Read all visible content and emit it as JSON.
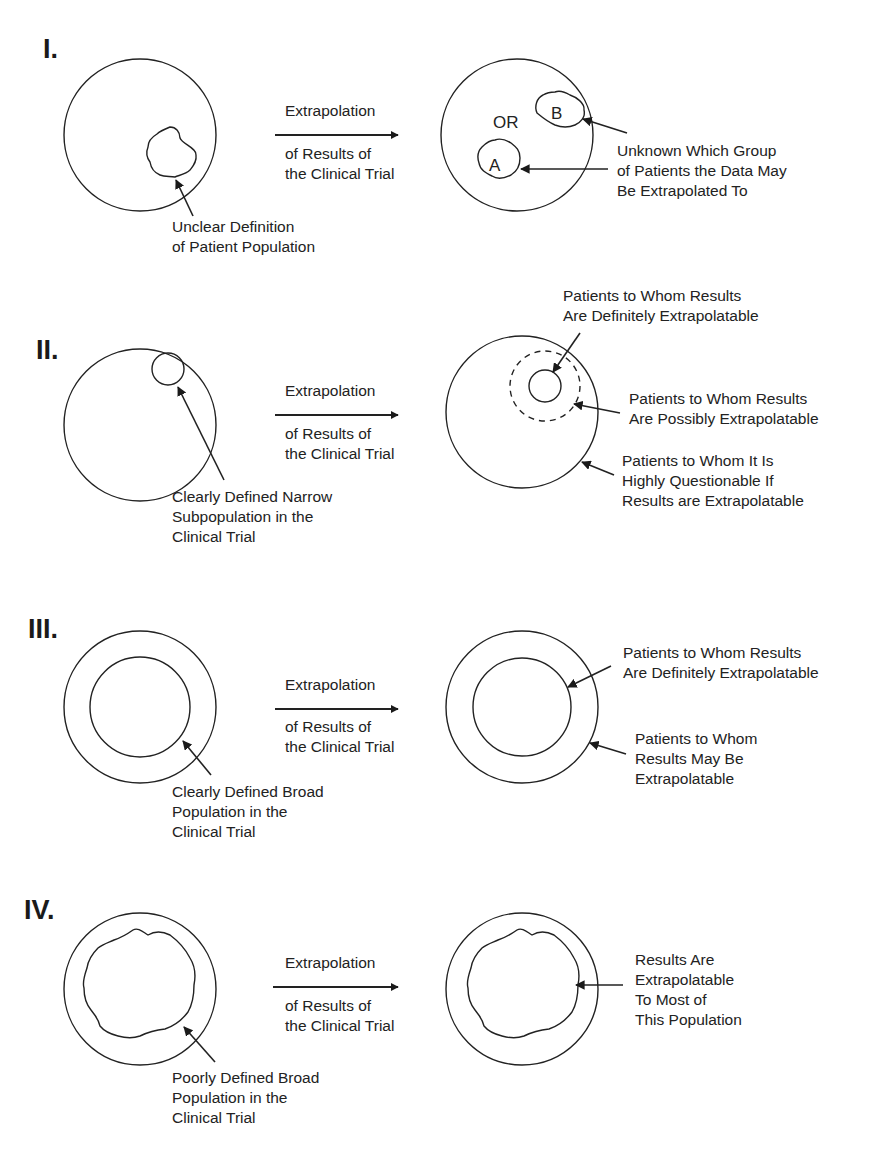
{
  "figure": {
    "panels": [
      {
        "numeral": "I.",
        "arrow_top": "Extrapolation",
        "arrow_bottom": [
          "of Results of",
          "the Clinical Trial"
        ],
        "left_caption": [
          "Unclear Definition",
          "of Patient Population"
        ],
        "right_labels": {
          "or": "OR",
          "group_a": "A",
          "group_b": "B",
          "caption": [
            "Unknown Which Group",
            "of Patients the Data May",
            "Be Extrapolated To"
          ]
        }
      },
      {
        "numeral": "II.",
        "arrow_top": "Extrapolation",
        "arrow_bottom": [
          "of Results of",
          "the Clinical Trial"
        ],
        "left_caption": [
          "Clearly Defined Narrow",
          "Subpopulation in the",
          "Clinical Trial"
        ],
        "right_labels": {
          "definitely": [
            "Patients to Whom Results",
            "Are Definitely Extrapolatable"
          ],
          "possibly": [
            "Patients to Whom Results",
            "Are Possibly Extrapolatable"
          ],
          "questionable": [
            "Patients to Whom It Is",
            "Highly Questionable If",
            "Results are Extrapolatable"
          ]
        }
      },
      {
        "numeral": "III.",
        "arrow_top": "Extrapolation",
        "arrow_bottom": [
          "of Results of",
          "the Clinical Trial"
        ],
        "left_caption": [
          "Clearly Defined Broad",
          "Population in the",
          "Clinical Trial"
        ],
        "right_labels": {
          "definitely": [
            "Patients to Whom Results",
            "Are Definitely Extrapolatable"
          ],
          "may_be": [
            "Patients to Whom",
            "Results May Be",
            "Extrapolatable"
          ]
        }
      },
      {
        "numeral": "IV.",
        "arrow_top": "Extrapolation",
        "arrow_bottom": [
          "of Results of",
          "the Clinical Trial"
        ],
        "left_caption": [
          "Poorly Defined Broad",
          "Population in the",
          "Clinical Trial"
        ],
        "right_labels": {
          "most": [
            "Results Are",
            "Extrapolatable",
            "To Most of",
            "This Population"
          ]
        }
      }
    ]
  }
}
